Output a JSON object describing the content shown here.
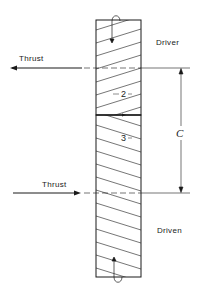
{
  "diagram": {
    "type": "crossed-helical-gears-side-view",
    "gears": [
      {
        "id": "2",
        "label": "2",
        "role_label": "Driver",
        "hatch": "rising-left-to-right",
        "rotation_arrow": "down"
      },
      {
        "id": "3",
        "label": "3",
        "role_label": "Driven",
        "hatch": "falling-left-to-right",
        "rotation_arrow": "up"
      }
    ],
    "thrust_top": {
      "label": "Thrust",
      "direction": "left"
    },
    "thrust_bottom": {
      "label": "Thrust",
      "direction": "right"
    },
    "center_distance": {
      "label": "C"
    },
    "colors": {
      "ink": "#1a1a1a",
      "background": "#ffffff"
    }
  }
}
